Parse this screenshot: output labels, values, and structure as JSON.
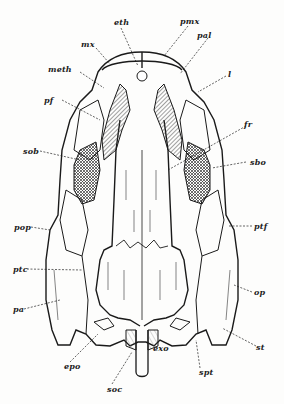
{
  "figure": {
    "ink_color": "#1a1a1a",
    "paper_color": "#fdfdfc",
    "hatch_color": "#555555"
  },
  "labels": {
    "eth": "eth",
    "pmx": "pmx",
    "mx": "mx",
    "pal": "pal",
    "meth": "meth",
    "l": "l",
    "pf": "pf",
    "fr": "fr",
    "sob": "sob",
    "sbo": "sbo",
    "pop": "pop",
    "ptf": "ptf",
    "ptc": "ptc",
    "op": "op",
    "pa": "pa",
    "st": "st",
    "epo": "epo",
    "exo": "exo",
    "spt": "spt",
    "soc": "soc"
  }
}
